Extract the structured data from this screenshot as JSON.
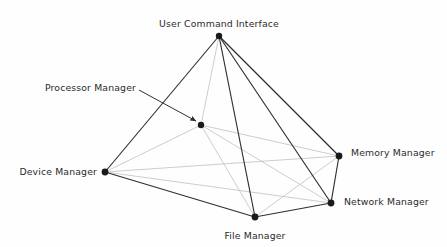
{
  "figure": {
    "background_color": "#fefefe",
    "edge_color_outer": "#2f2f2f",
    "edge_color_inner": "#b8b8b8",
    "node_color": "#1a1a1a",
    "label_color": "#2b2b2b",
    "width": 447,
    "height": 247
  },
  "nodes": [
    {
      "id": "user_command_interface",
      "label": "User Command Interface",
      "x": 219,
      "y": 36,
      "label_x": 219,
      "label_y": 24,
      "anchor": "mid",
      "radius": 3.2
    },
    {
      "id": "processor_manager",
      "label": "Processor Manager",
      "x": 201,
      "y": 125,
      "label_x": 136,
      "label_y": 88,
      "anchor": "end",
      "radius": 3.2
    },
    {
      "id": "device_manager",
      "label": "Device Manager",
      "x": 105,
      "y": 172,
      "label_x": 97,
      "label_y": 172,
      "anchor": "end",
      "radius": 3.4
    },
    {
      "id": "memory_manager",
      "label": "Memory Manager",
      "x": 339,
      "y": 156,
      "label_x": 351,
      "label_y": 153,
      "anchor": "start",
      "radius": 3.4
    },
    {
      "id": "network_manager",
      "label": "Network Manager",
      "x": 331,
      "y": 203,
      "label_x": 344,
      "label_y": 202,
      "anchor": "start",
      "radius": 3.4
    },
    {
      "id": "file_manager",
      "label": "File Manager",
      "x": 255,
      "y": 217,
      "label_x": 255,
      "label_y": 236,
      "anchor": "mid",
      "radius": 3.4
    }
  ],
  "edges": [
    {
      "from": "user_command_interface",
      "to": "device_manager",
      "weight": "outer"
    },
    {
      "from": "user_command_interface",
      "to": "file_manager",
      "weight": "outer"
    },
    {
      "from": "user_command_interface",
      "to": "memory_manager",
      "weight": "outer"
    },
    {
      "from": "user_command_interface",
      "to": "network_manager",
      "weight": "outer"
    },
    {
      "from": "user_command_interface",
      "to": "processor_manager",
      "weight": "inner"
    },
    {
      "from": "device_manager",
      "to": "processor_manager",
      "weight": "inner"
    },
    {
      "from": "device_manager",
      "to": "memory_manager",
      "weight": "inner"
    },
    {
      "from": "device_manager",
      "to": "network_manager",
      "weight": "inner"
    },
    {
      "from": "device_manager",
      "to": "file_manager",
      "weight": "outer"
    },
    {
      "from": "processor_manager",
      "to": "memory_manager",
      "weight": "inner"
    },
    {
      "from": "processor_manager",
      "to": "network_manager",
      "weight": "inner"
    },
    {
      "from": "processor_manager",
      "to": "file_manager",
      "weight": "inner"
    },
    {
      "from": "memory_manager",
      "to": "network_manager",
      "weight": "outer"
    },
    {
      "from": "memory_manager",
      "to": "file_manager",
      "weight": "inner"
    },
    {
      "from": "file_manager",
      "to": "network_manager",
      "weight": "outer"
    }
  ],
  "callout": {
    "target_node": "processor_manager",
    "label": "Processor Manager",
    "line_start_x": 139,
    "line_start_y": 90,
    "line_end_x": 196,
    "line_end_y": 121,
    "color": "#2f2f2f"
  }
}
